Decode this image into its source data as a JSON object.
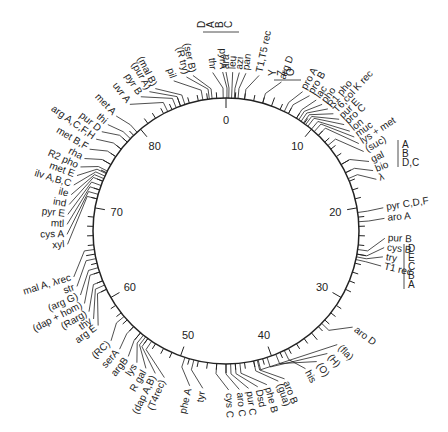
{
  "diagram": {
    "title": "",
    "type": "circular genetic map",
    "center": [
      226,
      231
    ],
    "radius": 133,
    "total_minutes": 90,
    "line_color": "#222222",
    "background": "#ffffff",
    "scale_labels": [
      {
        "min": 0,
        "text": "0"
      },
      {
        "min": 10,
        "text": "10"
      },
      {
        "min": 20,
        "text": "20"
      },
      {
        "min": 30,
        "text": "30"
      },
      {
        "min": 40,
        "text": "40"
      },
      {
        "min": 50,
        "text": "50"
      },
      {
        "min": 60,
        "text": "60"
      },
      {
        "min": 70,
        "text": "70"
      },
      {
        "min": 80,
        "text": "80"
      }
    ],
    "genes": [
      {
        "min": 0.1,
        "text": "pyrA",
        "angle": -0.5
      },
      {
        "min": 0.3,
        "text": "ara",
        "angle": 0
      },
      {
        "min": 0.6,
        "text": "leu",
        "angle": 1
      },
      {
        "min": 0.9,
        "text": "azi",
        "angle": 2
      },
      {
        "min": 1.3,
        "text": "pan",
        "angle": 3
      },
      {
        "min": 2.0,
        "text": "T1,T5 rec",
        "angle": 5
      },
      {
        "min": -0.3,
        "text": "thr",
        "angle": -2
      },
      {
        "min": -1.5,
        "text": "(ser B)",
        "angle": -5
      },
      {
        "min": -1.8,
        "text": "(R try)",
        "angle": -6
      },
      {
        "min": -2.5,
        "text": "pil",
        "angle": -8
      },
      {
        "min": -4.5,
        "text": "(mal B)",
        "angle": -11
      },
      {
        "min": -5.0,
        "text": "(pur A)",
        "angle": -12
      },
      {
        "min": -5.5,
        "text": "pyr B",
        "angle": -13.5
      },
      {
        "min": -6.5,
        "text": "uvr A",
        "angle": -15.5
      },
      {
        "min": 4.0,
        "text": "arg D",
        "angle": 8.5
      },
      {
        "min": 6.5,
        "text": "pro A",
        "angle": 12
      },
      {
        "min": 7.0,
        "text": "pro B",
        "angle": 13.2
      },
      {
        "min": 8.0,
        "text": "lac",
        "angle": 14.4
      },
      {
        "min": 8.3,
        "text": "pho",
        "angle": 15.5
      },
      {
        "min": 8.6,
        "text": "R1 pho",
        "angle": 16.6
      },
      {
        "min": 8.9,
        "text": "T6,col K rec",
        "angle": 17.7
      },
      {
        "min": 9.2,
        "text": "pur E",
        "angle": 18.9
      },
      {
        "min": 9.5,
        "text": "pro C",
        "angle": 20.0
      },
      {
        "min": 10.0,
        "text": "lon",
        "angle": 21.3
      },
      {
        "min": 10.4,
        "text": "muc",
        "angle": 22.4
      },
      {
        "min": 11.0,
        "text": "lys + met",
        "angle": 23.6
      },
      {
        "min": 12.5,
        "text": "(suc)",
        "angle": 25.0
      },
      {
        "min": 15.0,
        "text": "gal",
        "angle": 26.7
      },
      {
        "min": 16.0,
        "text": "bio",
        "angle": 28.2
      },
      {
        "min": 16.7,
        "text": "λ",
        "angle": 29.6
      },
      {
        "min": 20.5,
        "text": "pyr C,D,F",
        "angle": 34
      },
      {
        "min": 21.5,
        "text": "aro A",
        "angle": 35.6
      },
      {
        "min": 24.5,
        "text": "pur B",
        "angle": 38.6
      },
      {
        "min": 25.0,
        "text": "cys B",
        "angle": 40
      },
      {
        "min": 25.3,
        "text": "try",
        "angle": 41.4
      },
      {
        "min": 25.6,
        "text": "T1 rec",
        "angle": 42.8
      },
      {
        "min": 33.5,
        "text": "aro D",
        "angle": 53
      },
      {
        "min": 38.5,
        "text": "his",
        "angle": 62.5
      },
      {
        "min": 39.5,
        "text": "(O)",
        "angle": 60.5
      },
      {
        "min": 40.5,
        "text": "(H)",
        "angle": 58.5
      },
      {
        "min": 41.5,
        "text": "(fla)",
        "angle": 56.5
      },
      {
        "min": 41.6,
        "text": "aro B",
        "angle": 66
      },
      {
        "min": 42.0,
        "text": "(gua)",
        "angle": 67
      },
      {
        "min": 43.5,
        "text": "phe B",
        "angle": 68.8
      },
      {
        "min": 44.0,
        "text": "Dsd",
        "angle": 70.2
      },
      {
        "min": 44.5,
        "text": "pur C",
        "angle": 71.6
      },
      {
        "min": 45.0,
        "text": "aro C",
        "angle": 73
      },
      {
        "min": 46.0,
        "text": "cys C",
        "angle": 74.6
      },
      {
        "min": 48.5,
        "text": "tyr",
        "angle": 78.5
      },
      {
        "min": 49.5,
        "text": "phe A",
        "angle": 80.5
      },
      {
        "min": 53.5,
        "text": "(T4rec)",
        "angle": 84.5
      },
      {
        "min": 54.0,
        "text": "(dap A,B)",
        "angle": 86
      },
      {
        "min": 54.3,
        "text": "R gal",
        "angle": 87.6
      },
      {
        "min": 54.6,
        "text": "lys",
        "angle": 89.2
      },
      {
        "min": 55.0,
        "text": "argB",
        "angle": 90.8
      },
      {
        "min": 56.0,
        "text": "serA",
        "angle": 92.5
      },
      {
        "min": 57.5,
        "text": "(RC)",
        "angle": 94.3
      },
      {
        "min": 61.0,
        "text": "arg E",
        "angle": 97.3
      },
      {
        "min": 61.5,
        "text": "thy",
        "angle": 98.5
      },
      {
        "min": 62.0,
        "text": "(Rarg)",
        "angle": 99.8
      },
      {
        "min": 63.0,
        "text": "(dap + hom)",
        "angle": 101.2
      },
      {
        "min": 63.5,
        "text": "(arg G)",
        "angle": 102.6
      },
      {
        "min": 64.5,
        "text": "str",
        "angle": 104
      },
      {
        "min": 65.5,
        "text": "mal A, λrec",
        "angle": 105.5
      },
      {
        "min": 71.0,
        "text": "xyl",
        "angle": 110.5
      },
      {
        "min": 71.5,
        "text": "cys A",
        "angle": 112
      },
      {
        "min": 72.0,
        "text": "mtl",
        "angle": 113.5
      },
      {
        "min": 72.5,
        "text": "pyr E",
        "angle": 115
      },
      {
        "min": 73.0,
        "text": "ind",
        "angle": 116.5
      },
      {
        "min": 73.3,
        "text": "ile",
        "angle": 118
      },
      {
        "min": 73.6,
        "text": "ilv A,B,C",
        "angle": 119.5
      },
      {
        "min": 73.9,
        "text": "met E",
        "angle": 121
      },
      {
        "min": 74.2,
        "text": "R2 pho",
        "angle": 122.4
      },
      {
        "min": 75.0,
        "text": "rha",
        "angle": 123.8
      },
      {
        "min": 76.0,
        "text": "met B,F",
        "angle": 125.4
      },
      {
        "min": 77.0,
        "text": "arg A,C,F,H",
        "angle": 127.2
      },
      {
        "min": 78.0,
        "text": "pur D",
        "angle": 128.6
      },
      {
        "min": 78.5,
        "text": "thi",
        "angle": 130
      },
      {
        "min": 79.5,
        "text": "met A",
        "angle": 131.8
      }
    ],
    "operon_groups": [
      {
        "name": "ara-group",
        "letters": [
          "D",
          "A",
          "B",
          "C"
        ]
      },
      {
        "name": "gal-group",
        "letters": [
          "A",
          "B",
          "D,C"
        ]
      },
      {
        "name": "try-group",
        "letters": [
          "D",
          "E",
          "C",
          "B",
          "A"
        ]
      },
      {
        "name": "lys-met-group",
        "letters": [
          "Y",
          "Z",
          "O"
        ]
      }
    ]
  }
}
